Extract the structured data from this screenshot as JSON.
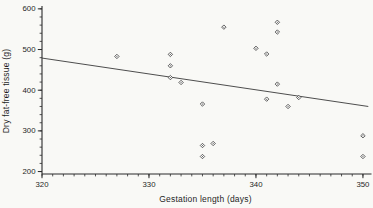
{
  "figure": {
    "background": "#f9f9f6",
    "axis_color": "#2b2b2b",
    "marker_color": "#3a3a3a",
    "marker_fill": "#fcfcfb",
    "trend_line_color": "#3a3a3a",
    "tick_label_color": "#1f1f1f"
  },
  "chart_data": {
    "type": "scatter",
    "title": "",
    "xlabel": "Gestation length (days)",
    "ylabel": "Dry fat-free tissue (g)",
    "xlim": [
      320,
      350.8
    ],
    "ylim": [
      194,
      607
    ],
    "x_ticks_major": [
      320,
      330,
      340,
      350
    ],
    "x_minor_step": 1,
    "x_minor_range": [
      320,
      350
    ],
    "y_ticks_major": [
      200,
      300,
      400,
      500,
      600
    ],
    "y_minor_step": 20,
    "y_minor_range": [
      200,
      600
    ],
    "grid": false,
    "legend": null,
    "points": [
      [
        327,
        483
      ],
      [
        332,
        488
      ],
      [
        332,
        460
      ],
      [
        332,
        431
      ],
      [
        333,
        419
      ],
      [
        335,
        366
      ],
      [
        335,
        264
      ],
      [
        335,
        237
      ],
      [
        336,
        269
      ],
      [
        337,
        555
      ],
      [
        340,
        503
      ],
      [
        341,
        489
      ],
      [
        341,
        378
      ],
      [
        342,
        567
      ],
      [
        342,
        543
      ],
      [
        342,
        415
      ],
      [
        343,
        360
      ],
      [
        344,
        382
      ],
      [
        350,
        288
      ],
      [
        350,
        237
      ]
    ],
    "trend_line": {
      "x1": 320,
      "y1": 479,
      "x2": 350.5,
      "y2": 360
    }
  }
}
